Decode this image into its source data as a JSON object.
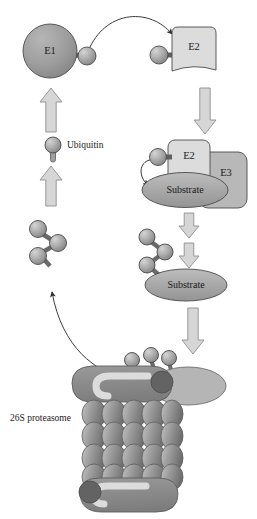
{
  "figure": {
    "background_color": "#ffffff"
  },
  "labels": {
    "e1": "E1",
    "e2_top": "E2",
    "e2_complex": "E2",
    "e3": "E3",
    "substrate_bound": "Substrate",
    "substrate_tagged": "Substrate",
    "ubiquitin": "Ubiquitin",
    "proteasome": "26S proteasome"
  },
  "colors": {
    "e1_fill": "#9d9d9d",
    "e2_fill": "#d8d8d8",
    "e3_fill": "#b4b4b4",
    "substrate_fill": "#a8a8a8",
    "ubiquitin_fill": "#a9a9a9",
    "ubiquitin_highlight": "#c9c9c9",
    "block_arrow_fill": "#d6d6d6",
    "block_arrow_stroke": "#8a8a8a",
    "proteasome_cap": "#8a8a8a",
    "proteasome_cap_dark": "#6f6f6f",
    "proteasome_channel": "#d9d9d9",
    "proteasome_ring": "#8e8e8e",
    "proteasome_subunit": "#9a9a9a",
    "lid_ellipse": "#b0b0b0",
    "outline": "#4a4a4a",
    "text": "#1a1a1a"
  },
  "shapes": {
    "e1": {
      "cx": 50,
      "cy": 51,
      "r": 27
    },
    "e1_ubiquitin": {
      "cx": 87,
      "cy": 56,
      "r": 9
    },
    "e2_top": {
      "x": 166,
      "y": 27,
      "w": 50,
      "h": 47
    },
    "e2_top_ubiquitin": {
      "cx": 159,
      "cy": 55,
      "r": 9
    },
    "e2_complex": {
      "x": 168,
      "y": 140,
      "w": 42,
      "h": 46
    },
    "e3": {
      "x": 199,
      "y": 152,
      "w": 48,
      "h": 56
    },
    "substrate_bound": {
      "cx": 185,
      "cy": 189,
      "rx": 42,
      "ry": 17
    },
    "substrate_tagged": {
      "cx": 186,
      "cy": 284,
      "rx": 40,
      "ry": 16
    },
    "ubiquitin_legend": {
      "cx": 53,
      "cy": 145,
      "r": 8
    },
    "free_chain_origin": {
      "x": 30,
      "y": 222
    },
    "bound_chain_origin": {
      "x": 142,
      "y": 232
    },
    "proteasome": {
      "cx": 127,
      "cy": 430,
      "w": 120,
      "h": 150
    }
  },
  "arrows": {
    "block": [
      {
        "name": "e1-recharge-up",
        "x": 51,
        "y": 88,
        "dir": "up",
        "len": 44,
        "w": 22
      },
      {
        "name": "ubiquitin-supply-up",
        "x": 51,
        "y": 168,
        "dir": "up",
        "len": 38,
        "w": 22
      },
      {
        "name": "e2-to-complex-down",
        "x": 205,
        "y": 86,
        "dir": "down",
        "len": 48,
        "w": 22
      },
      {
        "name": "complex-to-chain-down",
        "x": 189,
        "y": 214,
        "dir": "down",
        "len": 24,
        "w": 20
      },
      {
        "name": "chain-to-substrate-down",
        "x": 189,
        "y": 244,
        "dir": "down",
        "len": 24,
        "w": 20
      },
      {
        "name": "substrate-to-proteasome-down",
        "x": 191,
        "y": 308,
        "dir": "down",
        "len": 48,
        "w": 22
      }
    ],
    "curved": [
      {
        "name": "e1-to-e2-transfer",
        "from": "E1-ubiquitin",
        "to": "E2"
      },
      {
        "name": "ubiquitin-to-substrate-transfer",
        "from": "E2-ubiquitin",
        "to": "Substrate"
      },
      {
        "name": "ubiquitin-recycling",
        "from": "proteasome",
        "to": "free-ubiquitin-chain"
      }
    ]
  },
  "chain_balls": {
    "free": [
      {
        "cx": 39,
        "cy": 230,
        "r": 8
      },
      {
        "cx": 57,
        "cy": 243,
        "r": 8
      },
      {
        "cx": 38,
        "cy": 254,
        "r": 8
      }
    ],
    "bound": [
      {
        "cx": 148,
        "cy": 239,
        "r": 8
      },
      {
        "cx": 164,
        "cy": 252,
        "r": 8
      },
      {
        "cx": 147,
        "cy": 266,
        "r": 8
      }
    ],
    "at_proteasome": [
      {
        "cx": 132,
        "cy": 360,
        "r": 8
      },
      {
        "cx": 150,
        "cy": 355,
        "r": 8
      },
      {
        "cx": 168,
        "cy": 358,
        "r": 8
      }
    ]
  }
}
